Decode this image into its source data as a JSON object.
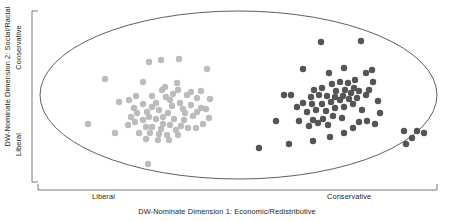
{
  "chart_data": {
    "type": "scatter",
    "title": "",
    "xlabel": "DW-Nominate Dimension 1: Economic/Redistributive",
    "ylabel": "DW-Nominate Dimension 2: Social/Racial",
    "x_tick_labels": [
      "Liberal",
      "Conservative"
    ],
    "y_tick_labels": [
      "Conservative",
      "Liberal"
    ],
    "xlim": [
      -1,
      1
    ],
    "ylim": [
      -1,
      1
    ],
    "grid": false,
    "legend": "none",
    "boundary": {
      "shape": "ellipse",
      "cx": 238.5,
      "cy": 95,
      "rx": 198.5,
      "ry": 84,
      "stroke": "#4d4d4d"
    },
    "series": [
      {
        "name": "Liberal bloc",
        "color": "#bcbcbc",
        "marker": "circle",
        "marker_size": 3.2,
        "points": [
          [
            105,
            79
          ],
          [
            149,
            62
          ],
          [
            161,
            60
          ],
          [
            179,
            59
          ],
          [
            165,
            87
          ],
          [
            207,
            69
          ],
          [
            143,
            82
          ],
          [
            177,
            83
          ],
          [
            119,
            102
          ],
          [
            131,
            117
          ],
          [
            152,
            107
          ],
          [
            197,
            98
          ],
          [
            210,
            99
          ],
          [
            173,
            94
          ],
          [
            187,
            95
          ],
          [
            166,
            97
          ],
          [
            180,
            103
          ],
          [
            197,
            112
          ],
          [
            209,
            118
          ],
          [
            135,
            122
          ],
          [
            143,
            120
          ],
          [
            152,
            127
          ],
          [
            161,
            129
          ],
          [
            170,
            125
          ],
          [
            184,
            120
          ],
          [
            156,
            103
          ],
          [
            159,
            110
          ],
          [
            147,
            112
          ],
          [
            168,
            113
          ],
          [
            176,
            130
          ],
          [
            188,
            128
          ],
          [
            143,
            104
          ],
          [
            152,
            96
          ],
          [
            134,
            108
          ],
          [
            163,
            117
          ],
          [
            172,
            106
          ],
          [
            191,
            105
          ],
          [
            203,
            124
          ],
          [
            150,
            133
          ],
          [
            159,
            134
          ],
          [
            178,
            135
          ],
          [
            167,
            135
          ],
          [
            139,
            133
          ],
          [
            128,
            125
          ],
          [
            115,
            133
          ],
          [
            193,
            116
          ],
          [
            201,
            108
          ],
          [
            183,
            109
          ],
          [
            174,
            119
          ],
          [
            156,
            119
          ],
          [
            146,
            127
          ],
          [
            137,
            113
          ],
          [
            170,
            100
          ],
          [
            185,
            113
          ],
          [
            196,
            128
          ],
          [
            149,
            117
          ],
          [
            163,
            124
          ],
          [
            181,
            126
          ],
          [
            129,
            100
          ],
          [
            88,
            124
          ],
          [
            148,
            164
          ],
          [
            158,
            140
          ],
          [
            169,
            140
          ],
          [
            146,
            139
          ],
          [
            136,
            96
          ],
          [
            201,
            91
          ],
          [
            206,
            109
          ],
          [
            191,
            92
          ],
          [
            178,
            90
          ],
          [
            162,
            90
          ]
        ]
      },
      {
        "name": "Conservative bloc",
        "color": "#555555",
        "marker": "circle",
        "marker_size": 3.2,
        "points": [
          [
            321,
            42
          ],
          [
            361,
            41
          ],
          [
            303,
            69
          ],
          [
            344,
            68
          ],
          [
            329,
            73
          ],
          [
            372,
            70
          ],
          [
            284,
            95
          ],
          [
            291,
            95
          ],
          [
            373,
            82
          ],
          [
            354,
            88
          ],
          [
            314,
            90
          ],
          [
            322,
            88
          ],
          [
            332,
            84
          ],
          [
            340,
            82
          ],
          [
            348,
            83
          ],
          [
            355,
            80
          ],
          [
            311,
            97
          ],
          [
            319,
            95
          ],
          [
            327,
            96
          ],
          [
            335,
            97
          ],
          [
            343,
            96
          ],
          [
            351,
            93
          ],
          [
            359,
            91
          ],
          [
            303,
            103
          ],
          [
            312,
            104
          ],
          [
            322,
            104
          ],
          [
            331,
            102
          ],
          [
            340,
            100
          ],
          [
            349,
            99
          ],
          [
            357,
            98
          ],
          [
            366,
            95
          ],
          [
            307,
            112
          ],
          [
            316,
            110
          ],
          [
            326,
            111
          ],
          [
            335,
            108
          ],
          [
            344,
            107
          ],
          [
            353,
            104
          ],
          [
            362,
            110
          ],
          [
            297,
            107
          ],
          [
            313,
            120
          ],
          [
            323,
            119
          ],
          [
            333,
            116
          ],
          [
            342,
            118
          ],
          [
            299,
            121
          ],
          [
            309,
            126
          ],
          [
            318,
            123
          ],
          [
            328,
            125
          ],
          [
            276,
            121
          ],
          [
            359,
            122
          ],
          [
            367,
            121
          ],
          [
            375,
            124
          ],
          [
            344,
            133
          ],
          [
            353,
            128
          ],
          [
            330,
            137
          ],
          [
            313,
            141
          ],
          [
            289,
            144
          ],
          [
            369,
            90
          ],
          [
            378,
            101
          ],
          [
            336,
            91
          ],
          [
            345,
            90
          ],
          [
            404,
            131
          ],
          [
            417,
            131
          ],
          [
            412,
            138
          ],
          [
            406,
            144
          ],
          [
            424,
            133
          ],
          [
            259,
            148
          ],
          [
            366,
            73
          ],
          [
            380,
            113
          ]
        ]
      }
    ]
  },
  "axes": {
    "x_bracket": {
      "x1": 38,
      "x2": 437,
      "y": 190,
      "tick_height": 6
    },
    "y_bracket": {
      "y1": 11,
      "y2": 182,
      "x": 32,
      "tick_width": 6
    }
  }
}
